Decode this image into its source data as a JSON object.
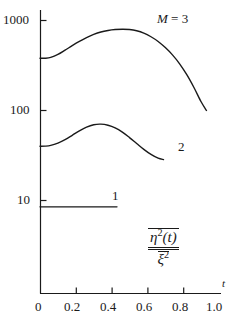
{
  "chart_data": {
    "type": "line",
    "title": "",
    "subtitle": "",
    "xlabel": "t",
    "ylabel": "η²(t) / ξ²",
    "ylabel_numerator": "η",
    "ylabel_numerator_sup": "2",
    "ylabel_numerator_arg": "(t)",
    "ylabel_denominator": "ξ",
    "ylabel_denominator_sup": "2",
    "xscale": "linear",
    "yscale": "log",
    "xlim": [
      0,
      1.0
    ],
    "ylim": [
      1.0,
      2150
    ],
    "grid": false,
    "legend_position": "inline-curve-labels",
    "xticks": [
      0,
      0.2,
      0.4,
      0.6,
      0.8,
      1.0
    ],
    "xticklabels": [
      "0",
      "0.2",
      "0.4",
      "0.6",
      "0.8",
      "1.0"
    ],
    "yticks": [
      10,
      100,
      1000
    ],
    "yticklabels": [
      "10",
      "100",
      "1000"
    ],
    "line_color": "#1a1a1a",
    "axis_color": "#1a1a1a",
    "background_color": "#ffffff",
    "series": [
      {
        "name": "M = 3",
        "label": "M = 3",
        "label_prefix": "M",
        "label_eq": " = ",
        "label_value": "3",
        "x": [
          0.0,
          0.03,
          0.06,
          0.1,
          0.14,
          0.18,
          0.22,
          0.26,
          0.3,
          0.34,
          0.38,
          0.42,
          0.46,
          0.5,
          0.54,
          0.58,
          0.62,
          0.66,
          0.7,
          0.74,
          0.78,
          0.82,
          0.86,
          0.9,
          0.93
        ],
        "values": [
          380,
          381,
          390,
          420,
          468,
          525,
          585,
          645,
          700,
          745,
          775,
          793,
          800,
          795,
          770,
          725,
          660,
          585,
          500,
          415,
          330,
          250,
          180,
          125,
          100
        ]
      },
      {
        "name": "2",
        "label": "2",
        "x": [
          0.0,
          0.03,
          0.06,
          0.1,
          0.14,
          0.18,
          0.22,
          0.26,
          0.3,
          0.34,
          0.38,
          0.42,
          0.46,
          0.5,
          0.54,
          0.58,
          0.62,
          0.66,
          0.69
        ],
        "values": [
          40.0,
          40.2,
          41.0,
          43.5,
          47.5,
          53.0,
          59.5,
          65.5,
          69.5,
          70.5,
          68.5,
          64.0,
          57.5,
          50.0,
          43.0,
          37.0,
          32.5,
          29.5,
          28.5
        ]
      },
      {
        "name": "1",
        "label": "1",
        "x": [
          0.0,
          0.43
        ],
        "values": [
          8.5,
          8.5
        ]
      }
    ],
    "annotations": [
      {
        "text": "M = 3",
        "attached_to": "M = 3",
        "x": 0.68,
        "y": 1250
      },
      {
        "text": "2",
        "attached_to": "2",
        "x": 0.78,
        "y": 42
      },
      {
        "text": "1",
        "attached_to": "1",
        "x": 0.44,
        "y": 11.5
      }
    ]
  }
}
